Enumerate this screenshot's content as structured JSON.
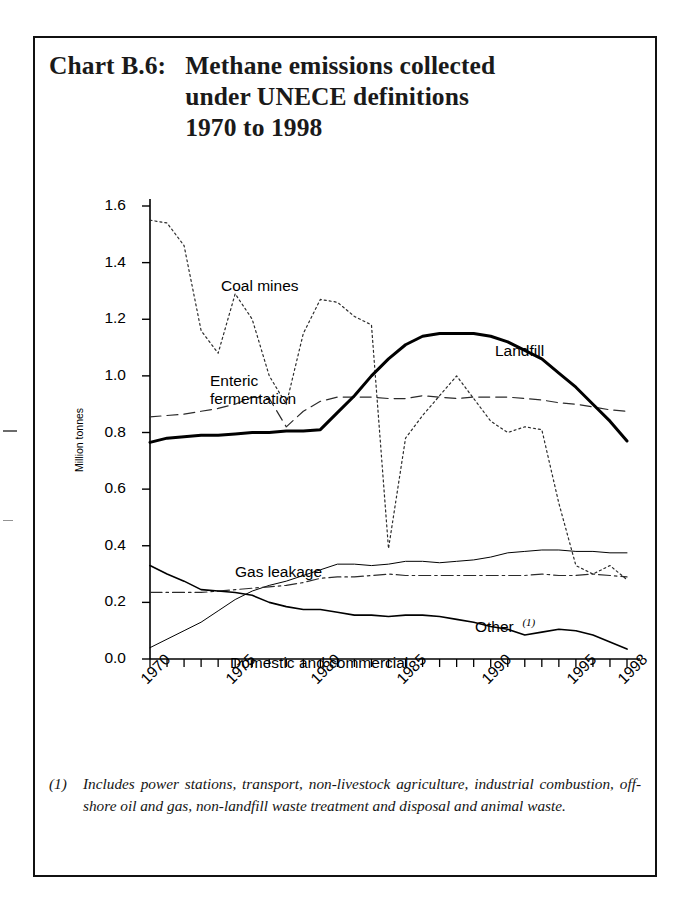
{
  "title": {
    "label": "Chart B.6:",
    "line1": "Methane emissions collected",
    "line2": "under UNECE definitions",
    "line3": "1970 to 1998"
  },
  "footnote": {
    "marker": "(1)",
    "text": "Includes power stations, transport, non-livestock agriculture, industrial combustion, off-shore oil and gas, non-landfill waste treatment and disposal and animal waste."
  },
  "chart_data": {
    "type": "line",
    "title": "Methane emissions collected under UNECE definitions 1970 to 1998",
    "xlabel": "",
    "ylabel": "Million tonnes",
    "xlim": [
      1970,
      1998
    ],
    "ylim": [
      0.0,
      1.6
    ],
    "grid": false,
    "legend_position": "inline-annotations",
    "yticks": [
      "0.0",
      "0.2",
      "0.4",
      "0.6",
      "0.8",
      "1.0",
      "1.2",
      "1.4",
      "1.6"
    ],
    "ytick_values": [
      0.0,
      0.2,
      0.4,
      0.6,
      0.8,
      1.0,
      1.2,
      1.4,
      1.6
    ],
    "xticks": [
      "1970",
      "1975",
      "1980",
      "1985",
      "1990",
      "1995",
      "1998"
    ],
    "xtick_values": [
      1970,
      1975,
      1980,
      1985,
      1990,
      1995,
      1998
    ],
    "x": [
      1970,
      1971,
      1972,
      1973,
      1974,
      1975,
      1976,
      1977,
      1978,
      1979,
      1980,
      1981,
      1982,
      1983,
      1984,
      1985,
      1986,
      1987,
      1988,
      1989,
      1990,
      1991,
      1992,
      1993,
      1994,
      1995,
      1996,
      1997,
      1998
    ],
    "series": [
      {
        "name": "Coal mines",
        "style": "dotted",
        "width": 1.2,
        "values": [
          1.55,
          1.54,
          1.46,
          1.16,
          1.08,
          1.29,
          1.2,
          1.0,
          0.9,
          1.15,
          1.27,
          1.26,
          1.21,
          1.18,
          0.39,
          0.78,
          0.86,
          0.93,
          1.0,
          0.92,
          0.84,
          0.8,
          0.82,
          0.81,
          0.55,
          0.33,
          0.3,
          0.33,
          0.28
        ]
      },
      {
        "name": "Enteric fermentation",
        "style": "dashed",
        "width": 1.2,
        "values": [
          0.855,
          0.86,
          0.865,
          0.875,
          0.885,
          0.9,
          0.925,
          0.92,
          0.82,
          0.875,
          0.91,
          0.925,
          0.925,
          0.925,
          0.92,
          0.92,
          0.93,
          0.925,
          0.92,
          0.925,
          0.925,
          0.925,
          0.92,
          0.915,
          0.905,
          0.9,
          0.89,
          0.88,
          0.875
        ]
      },
      {
        "name": "Landfill",
        "style": "solid",
        "width": 3.0,
        "values": [
          0.765,
          0.78,
          0.785,
          0.79,
          0.79,
          0.795,
          0.8,
          0.8,
          0.805,
          0.805,
          0.81,
          0.87,
          0.93,
          1.0,
          1.06,
          1.11,
          1.14,
          1.15,
          1.15,
          1.15,
          1.14,
          1.12,
          1.09,
          1.06,
          1.01,
          0.96,
          0.9,
          0.84,
          0.77
        ]
      },
      {
        "name": "Gas leakage",
        "style": "solid",
        "width": 1.0,
        "values": [
          0.04,
          0.07,
          0.1,
          0.13,
          0.17,
          0.21,
          0.24,
          0.26,
          0.275,
          0.295,
          0.315,
          0.335,
          0.335,
          0.33,
          0.335,
          0.345,
          0.345,
          0.34,
          0.345,
          0.35,
          0.36,
          0.375,
          0.38,
          0.385,
          0.385,
          0.38,
          0.38,
          0.375,
          0.375
        ]
      },
      {
        "name": "Other",
        "style": "dashdot",
        "width": 1.2,
        "values": [
          0.235,
          0.235,
          0.235,
          0.235,
          0.24,
          0.245,
          0.25,
          0.255,
          0.26,
          0.27,
          0.285,
          0.29,
          0.29,
          0.295,
          0.3,
          0.295,
          0.295,
          0.295,
          0.295,
          0.295,
          0.295,
          0.295,
          0.295,
          0.3,
          0.295,
          0.295,
          0.3,
          0.295,
          0.29
        ]
      },
      {
        "name": "Domestic and commercial",
        "style": "solid",
        "width": 1.6,
        "values": [
          0.33,
          0.3,
          0.275,
          0.245,
          0.24,
          0.235,
          0.225,
          0.2,
          0.185,
          0.175,
          0.175,
          0.165,
          0.155,
          0.155,
          0.15,
          0.155,
          0.155,
          0.15,
          0.14,
          0.13,
          0.115,
          0.105,
          0.085,
          0.095,
          0.105,
          0.1,
          0.085,
          0.06,
          0.035
        ]
      }
    ],
    "annotations": [
      {
        "name": "Coal mines",
        "text": "Coal mines"
      },
      {
        "name": "Enteric fermentation",
        "line1": "Enteric",
        "line2": "fermentation"
      },
      {
        "name": "Landfill",
        "text": "Landfill"
      },
      {
        "name": "Gas leakage",
        "text": "Gas leakage"
      },
      {
        "name": "Other",
        "text": "Other",
        "superscript": "(1)"
      },
      {
        "name": "Domestic and commercial",
        "text": "Domestic and commercial"
      }
    ]
  }
}
